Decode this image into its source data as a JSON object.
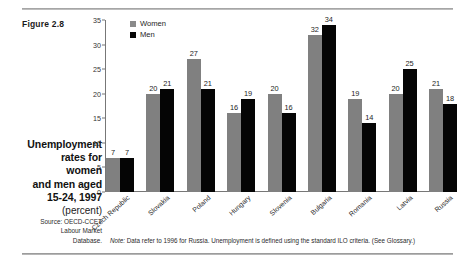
{
  "figure": {
    "label": "Figure 2.8",
    "caption_lines": [
      "Unemployment",
      "rates for",
      "women",
      "and men aged",
      "15-24, 1997"
    ],
    "units": "(percent)",
    "source_lines": [
      "Source: OECD-CCET",
      "Labour Market",
      "Database."
    ],
    "note_prefix": "Note:",
    "note": " Data refer to 1996 for Russia. Unemployment is defined using the standard ILO criteria. (See Glossary.)"
  },
  "legend": {
    "position": "top-left-inside",
    "entries": [
      {
        "label": "Women",
        "color": "#808080"
      },
      {
        "label": "Men",
        "color": "#050505"
      }
    ]
  },
  "chart_data": {
    "type": "bar",
    "title": "Unemployment rates for women and men aged 15-24, 1997 (percent)",
    "xlabel": "",
    "ylabel": "",
    "ylim": [
      0,
      35
    ],
    "yticks": [
      0,
      5,
      10,
      15,
      20,
      25,
      30,
      35
    ],
    "ytick_labels": [
      "0",
      "5",
      "10",
      "15",
      "20",
      "25",
      "30",
      "35"
    ],
    "grid": false,
    "categories": [
      "Czech Republic",
      "Slovakia",
      "Poland",
      "Hungary",
      "Slovenia",
      "Bulgaria",
      "Romania",
      "Latvia",
      "Russia"
    ],
    "series": [
      {
        "name": "Women",
        "color": "#808080",
        "values": [
          7,
          20,
          27,
          16,
          20,
          32,
          19,
          20,
          21
        ]
      },
      {
        "name": "Men",
        "color": "#050505",
        "values": [
          7,
          21,
          21,
          19,
          16,
          34,
          14,
          25,
          18
        ]
      }
    ]
  }
}
